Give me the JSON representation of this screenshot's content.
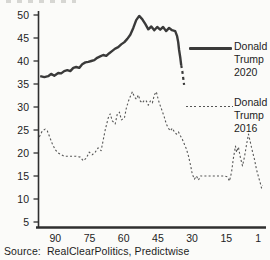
{
  "source_note": "Source:  RealClearPolitics, Predictwise",
  "legend": {
    "items": [
      {
        "l1": "Donald",
        "l2": "Trump",
        "l3": "2020",
        "style": "solid"
      },
      {
        "l1": "Donald",
        "l2": "Trump",
        "l3": "2016",
        "style": "dashed"
      }
    ]
  },
  "colors": {
    "line_2020": "#3a3a3a",
    "line_2016": "#555555",
    "axis": "#2f2f2f",
    "text": "#1d1d1d",
    "background": "#fbfbf9"
  },
  "chart_data": {
    "type": "line",
    "title": "",
    "xlabel": "",
    "ylabel": "",
    "grid": false,
    "legend_position": "right",
    "x_axis": {
      "ticks": [
        90,
        75,
        60,
        45,
        30,
        15,
        1
      ],
      "direction": "descending",
      "domain": [
        97,
        0
      ]
    },
    "y_axis": {
      "ticks": [
        5,
        10,
        15,
        20,
        25,
        30,
        35,
        40,
        45,
        50
      ],
      "domain": [
        5,
        50
      ]
    },
    "series": [
      {
        "name": "Donald Trump 2020",
        "line": "solid",
        "width": 2.4,
        "color": "#3a3a3a",
        "points": [
          [
            96.6,
            36.7
          ],
          [
            94.8,
            36.5
          ],
          [
            93.1,
            36.7
          ],
          [
            91.8,
            37.2
          ],
          [
            90.4,
            36.8
          ],
          [
            88.7,
            37.4
          ],
          [
            87.4,
            37.3
          ],
          [
            86.1,
            37.8
          ],
          [
            84.7,
            38.0
          ],
          [
            83.4,
            37.8
          ],
          [
            82.1,
            38.5
          ],
          [
            80.8,
            38.7
          ],
          [
            79.5,
            38.5
          ],
          [
            78.2,
            39.3
          ],
          [
            76.8,
            39.7
          ],
          [
            75.5,
            39.8
          ],
          [
            74.2,
            40.0
          ],
          [
            72.9,
            40.2
          ],
          [
            71.6,
            40.7
          ],
          [
            70.3,
            41.0
          ],
          [
            69.0,
            41.3
          ],
          [
            67.6,
            41.1
          ],
          [
            66.3,
            41.7
          ],
          [
            65.0,
            42.2
          ],
          [
            63.7,
            42.7
          ],
          [
            62.4,
            43.0
          ],
          [
            61.1,
            43.6
          ],
          [
            59.7,
            44.1
          ],
          [
            58.4,
            44.8
          ],
          [
            57.1,
            45.7
          ],
          [
            55.8,
            47.2
          ],
          [
            54.5,
            48.9
          ],
          [
            53.2,
            49.8
          ],
          [
            51.9,
            49.1
          ],
          [
            50.5,
            48.0
          ],
          [
            49.2,
            46.9
          ],
          [
            47.9,
            47.5
          ],
          [
            46.6,
            46.7
          ],
          [
            45.3,
            47.4
          ],
          [
            44.0,
            46.8
          ],
          [
            42.7,
            47.4
          ],
          [
            41.4,
            46.5
          ],
          [
            40.1,
            47.2
          ],
          [
            38.8,
            46.7
          ],
          [
            37.4,
            46.5
          ],
          [
            36.6,
            45.4
          ],
          [
            36.1,
            44.1
          ],
          [
            35.7,
            42.4
          ],
          [
            35.2,
            40.7
          ],
          [
            34.8,
            39.1
          ]
        ]
      },
      {
        "name": "Donald Trump 2020 (final sparse dashes)",
        "line": "dashed",
        "width": 2.2,
        "color": "#3a3a3a",
        "points": [
          [
            34.8,
            39.1
          ],
          [
            34.3,
            37.8
          ],
          [
            33.9,
            36.3
          ],
          [
            33.5,
            34.8
          ]
        ]
      },
      {
        "name": "Donald Trump 2016",
        "line": "dotted",
        "width": 1.1,
        "color": "#555555",
        "points": [
          [
            97.0,
            23.5
          ],
          [
            95.7,
            24.8
          ],
          [
            94.4,
            25.2
          ],
          [
            93.5,
            24.8
          ],
          [
            92.6,
            23.7
          ],
          [
            91.3,
            22.0
          ],
          [
            90.0,
            20.7
          ],
          [
            88.7,
            20.0
          ],
          [
            87.4,
            19.6
          ],
          [
            86.1,
            19.3
          ],
          [
            84.3,
            19.3
          ],
          [
            82.5,
            19.3
          ],
          [
            80.8,
            19.3
          ],
          [
            79.0,
            19.1
          ],
          [
            77.7,
            18.3
          ],
          [
            76.4,
            18.9
          ],
          [
            75.1,
            20.2
          ],
          [
            73.8,
            19.6
          ],
          [
            72.5,
            20.2
          ],
          [
            71.2,
            21.1
          ],
          [
            69.9,
            20.5
          ],
          [
            69.4,
            21.7
          ],
          [
            68.1,
            25.0
          ],
          [
            66.8,
            27.6
          ],
          [
            65.9,
            28.5
          ],
          [
            65.0,
            27.0
          ],
          [
            63.7,
            26.3
          ],
          [
            62.8,
            28.5
          ],
          [
            61.9,
            28.9
          ],
          [
            61.0,
            27.2
          ],
          [
            59.7,
            27.6
          ],
          [
            58.8,
            29.8
          ],
          [
            57.9,
            31.3
          ],
          [
            57.0,
            32.4
          ],
          [
            56.2,
            33.3
          ],
          [
            55.3,
            32.2
          ],
          [
            54.4,
            31.7
          ],
          [
            53.6,
            32.6
          ],
          [
            52.7,
            31.3
          ],
          [
            51.8,
            30.9
          ],
          [
            50.9,
            31.5
          ],
          [
            50.1,
            31.3
          ],
          [
            49.2,
            30.4
          ],
          [
            48.3,
            31.3
          ],
          [
            47.4,
            30.9
          ],
          [
            46.6,
            32.6
          ],
          [
            45.7,
            33.3
          ],
          [
            44.8,
            31.5
          ],
          [
            43.9,
            30.2
          ],
          [
            43.1,
            29.1
          ],
          [
            42.2,
            27.8
          ],
          [
            41.3,
            26.3
          ],
          [
            40.4,
            25.4
          ],
          [
            39.5,
            24.8
          ],
          [
            38.7,
            25.4
          ],
          [
            37.8,
            24.6
          ],
          [
            36.9,
            24.1
          ],
          [
            36.0,
            24.6
          ],
          [
            35.1,
            23.7
          ],
          [
            34.3,
            23.0
          ],
          [
            33.4,
            21.9
          ],
          [
            32.5,
            20.9
          ],
          [
            31.6,
            19.3
          ],
          [
            30.7,
            17.4
          ],
          [
            29.9,
            15.4
          ],
          [
            29.0,
            14.3
          ],
          [
            28.1,
            15.0
          ],
          [
            27.2,
            14.1
          ],
          [
            26.3,
            15.0
          ],
          [
            24.6,
            15.0
          ],
          [
            22.4,
            15.0
          ],
          [
            20.2,
            15.0
          ],
          [
            18.0,
            15.0
          ],
          [
            15.8,
            15.0
          ],
          [
            14.5,
            14.8
          ],
          [
            13.6,
            13.9
          ],
          [
            12.7,
            15.9
          ],
          [
            11.9,
            18.9
          ],
          [
            11.0,
            21.5
          ],
          [
            10.5,
            20.2
          ],
          [
            9.7,
            21.3
          ],
          [
            8.8,
            18.9
          ],
          [
            7.9,
            17.2
          ],
          [
            7.0,
            19.3
          ],
          [
            6.1,
            21.9
          ],
          [
            5.3,
            24.1
          ],
          [
            4.4,
            22.2
          ],
          [
            3.5,
            20.2
          ],
          [
            2.6,
            18.5
          ],
          [
            1.8,
            16.5
          ],
          [
            0.9,
            14.8
          ],
          [
            0.0,
            13.3
          ],
          [
            -0.4,
            12.4
          ],
          [
            -0.9,
            13.0
          ]
        ]
      }
    ]
  }
}
